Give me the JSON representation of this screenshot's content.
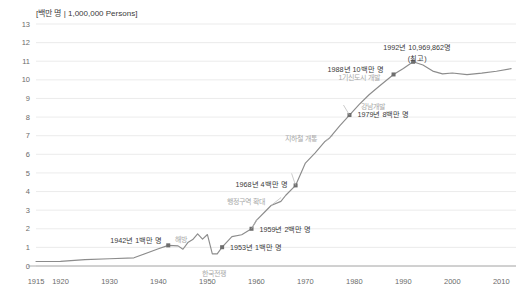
{
  "chart_data": {
    "type": "line",
    "title": "[백만 명 | 1,000,000 Persons]",
    "xlabel": "",
    "ylabel": "",
    "unit": "백만 명 | 1,000,000 Persons",
    "xlim": [
      1915,
      2013
    ],
    "ylim": [
      0,
      13
    ],
    "grid": true,
    "legend": "none",
    "yticks": [
      "0",
      "1",
      "2",
      "3",
      "4",
      "5",
      "6",
      "7",
      "8",
      "9",
      "10",
      "11",
      "12",
      "13"
    ],
    "xticks": [
      "1915",
      "1920",
      "1930",
      "1940",
      "1950",
      "1960",
      "1970",
      "1980",
      "1990",
      "2000",
      "2010"
    ],
    "series": [
      {
        "name": "서울 인구",
        "x": [
          1915,
          1920,
          1925,
          1930,
          1935,
          1940,
          1942,
          1944,
          1945,
          1946,
          1947,
          1948,
          1949,
          1950,
          1951,
          1952,
          1953,
          1955,
          1957,
          1959,
          1960,
          1962,
          1963,
          1965,
          1966,
          1968,
          1970,
          1972,
          1974,
          1975,
          1977,
          1979,
          1981,
          1983,
          1985,
          1988,
          1990,
          1992,
          1994,
          1996,
          1998,
          2000,
          2003,
          2006,
          2009,
          2012
        ],
        "y": [
          0.24,
          0.25,
          0.34,
          0.39,
          0.44,
          0.93,
          1.11,
          1.08,
          0.9,
          1.26,
          1.42,
          1.73,
          1.44,
          1.69,
          0.65,
          0.65,
          1.01,
          1.58,
          1.68,
          2.0,
          2.45,
          2.98,
          3.25,
          3.47,
          3.8,
          4.33,
          5.53,
          6.08,
          6.69,
          6.89,
          7.53,
          8.11,
          8.68,
          9.2,
          9.64,
          10.29,
          10.61,
          10.97,
          10.8,
          10.47,
          10.32,
          10.37,
          10.28,
          10.36,
          10.46,
          10.6
        ]
      }
    ],
    "annotations": [
      {
        "id": "ann-1942",
        "text": "1942년 1백만 명",
        "style": "dark",
        "year": 1942,
        "value": 1.11
      },
      {
        "id": "ann-liberation",
        "text": "해방",
        "style": "gray",
        "year": 1945,
        "value": 0.9
      },
      {
        "id": "ann-1953",
        "text": "1953년 1백만 명",
        "style": "dark",
        "year": 1953,
        "value": 1.01
      },
      {
        "id": "ann-korean-war",
        "text": "한국전쟁",
        "style": "gray",
        "year": 1951,
        "value": 0.65
      },
      {
        "id": "ann-1959",
        "text": "1959년 2백만 명",
        "style": "dark",
        "year": 1959,
        "value": 2.0
      },
      {
        "id": "ann-district",
        "text": "행정구역 확대",
        "style": "gray",
        "year": 1963,
        "value": 3.25
      },
      {
        "id": "ann-1968",
        "text": "1968년 4백만 명",
        "style": "dark",
        "year": 1968,
        "value": 4.33
      },
      {
        "id": "ann-subway",
        "text": "지하철 개통",
        "style": "gray",
        "year": 1974,
        "value": 6.69
      },
      {
        "id": "ann-1979",
        "text": "1979년 8백만 명",
        "style": "dark",
        "year": 1979,
        "value": 8.11
      },
      {
        "id": "ann-1988",
        "text": "1988년 10백만 명",
        "style": "dark",
        "year": 1988,
        "value": 10.29
      },
      {
        "id": "ann-newtown",
        "text": "1기신도시 개발",
        "style": "gray",
        "year": 1989,
        "value": 10.4
      },
      {
        "id": "ann-gangnam",
        "text": "강남개발",
        "style": "gray",
        "year": 1985,
        "value": 9.64
      },
      {
        "id": "ann-peak",
        "text": "1992년 10,969,862명",
        "style": "dark",
        "year": 1992,
        "value": 10.97
      },
      {
        "id": "ann-peak-sub",
        "text": "(최고)",
        "style": "dark",
        "year": 1992,
        "value": 10.97
      }
    ],
    "colors": {
      "line": "#8c8c8c",
      "grid": "#e2e2e2",
      "axis": "#9a9a9a",
      "annotation_dark": "#3a3a3a",
      "annotation_gray": "#a8a8a8",
      "background": "#ffffff"
    }
  }
}
